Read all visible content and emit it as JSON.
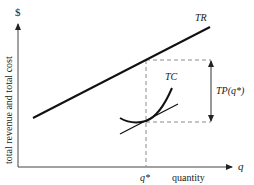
{
  "diagram": {
    "y_axis": {
      "symbol": "$",
      "label": "total revenue and total cost"
    },
    "x_axis": {
      "symbol": "q",
      "label": "quantity",
      "tick": "q*"
    },
    "curves": {
      "tr_label": "TR",
      "tc_label": "TC"
    },
    "annotation": {
      "tp_label": "TP(q*)"
    },
    "colors": {
      "line": "#111111",
      "dashed": "#8a8a8a",
      "text": "#1a1a1a"
    }
  }
}
